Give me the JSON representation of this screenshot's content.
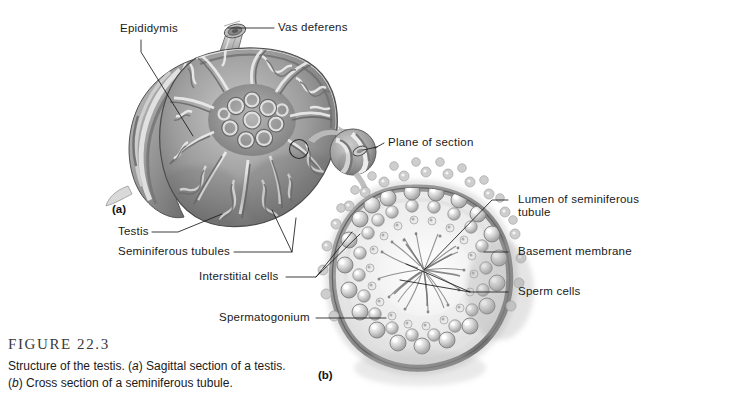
{
  "figure": {
    "number_text": "FIGURE 22.3",
    "caption_line_1_part_1": "Structure of the testis. (",
    "caption_line_1_italic": "a",
    "caption_line_1_part_2": ") Sagittal section of a testis.",
    "caption_line_2_italic": "b",
    "caption_line_2_part_1": "(",
    "caption_line_2_part_2": ") Cross section of a seminiferous tubule."
  },
  "panels": {
    "a_label": "(a)",
    "b_label": "(b)"
  },
  "labels": {
    "epididymis": "Epididymis",
    "vas_deferens": "Vas deferens",
    "plane_of_section": "Plane of section",
    "testis": "Testis",
    "seminiferous_tubules": "Seminiferous tubules",
    "interstitial_cells": "Interstitial cells",
    "spermatogonium": "Spermatogonium",
    "lumen_line_1": "Lumen of seminiferous",
    "lumen_line_2": "tubule",
    "basement_membrane": "Basement membrane",
    "sperm_cells": "Sperm cells"
  },
  "colors": {
    "background": "#ffffff",
    "text": "#1a1a1a",
    "figure_number": "#3a3a3a",
    "leader_line": "#1a1a1a",
    "art_dark": "#4a4a4a",
    "art_mid": "#8e8e8e",
    "art_light": "#d8d8d8",
    "art_highlight": "#f0f0f0",
    "arrow_gray": "#b9b9b9"
  }
}
